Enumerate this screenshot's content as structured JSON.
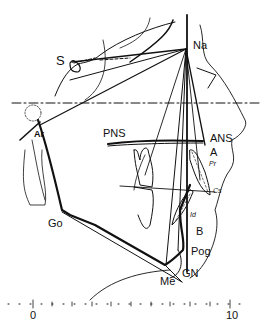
{
  "diagram": {
    "type": "cephalometric tracing",
    "landmarks": {
      "S": "S",
      "Na": "Na",
      "Ar": "Ar",
      "PNS": "PNS",
      "ANS": "ANS",
      "A": "A",
      "Pr": "Pr",
      "Cs": "Cs",
      "Id": "Id",
      "B": "B",
      "Pog": "Pog",
      "Go": "Go",
      "Me": "Me",
      "GN": "GN"
    },
    "scale": {
      "start_label": "0",
      "end_label": "10",
      "ticks": 21
    },
    "colors": {
      "ink": "#111111",
      "background": "#ffffff"
    }
  }
}
